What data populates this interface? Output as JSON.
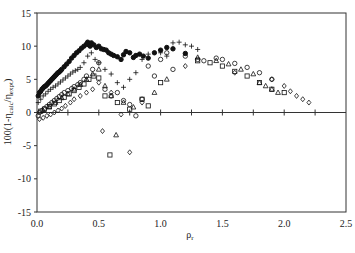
{
  "chart_data": {
    "type": "scatter",
    "title": "",
    "xlabel": "ρr",
    "xlabel_main": "ρ",
    "xlabel_sub": "r",
    "ylabel": "100(1-ηcalc/ηexpt)",
    "ylabel_parts": {
      "prefix": "100(1-η",
      "sub1": "calc",
      "mid": "/η",
      "sub2": "expt",
      "suffix": ")"
    },
    "xlim": [
      0,
      2.5
    ],
    "ylim": [
      -15,
      15
    ],
    "xticks": [
      "0.0",
      "0.5",
      "1.0",
      "1.5",
      "2.0",
      "2.5"
    ],
    "xtick_values": [
      0,
      0.5,
      1.0,
      1.5,
      2.0,
      2.5
    ],
    "yticks": [
      "15",
      "10",
      "5",
      "0",
      "-5",
      "-10",
      "-15"
    ],
    "ytick_values": [
      15,
      10,
      5,
      0,
      -5,
      -10,
      -15
    ],
    "zero_line_minor_ticks": [
      0.25,
      0.5,
      0.75,
      1.0,
      1.25,
      1.5,
      1.75,
      2.0,
      2.25
    ],
    "grid": false,
    "legend": "none",
    "series": [
      {
        "name": "filled-circle",
        "marker": "filled-circle",
        "x": [
          0.01,
          0.02,
          0.03,
          0.04,
          0.05,
          0.06,
          0.07,
          0.08,
          0.09,
          0.1,
          0.11,
          0.12,
          0.13,
          0.14,
          0.15,
          0.16,
          0.17,
          0.18,
          0.19,
          0.2,
          0.22,
          0.24,
          0.26,
          0.28,
          0.3,
          0.32,
          0.34,
          0.36,
          0.38,
          0.4,
          0.41,
          0.42,
          0.43,
          0.44,
          0.46,
          0.48,
          0.5,
          0.52,
          0.54,
          0.56,
          0.58,
          0.6,
          0.62,
          0.65,
          0.68,
          0.7,
          0.72,
          0.75,
          0.78,
          0.8,
          0.83,
          0.86,
          0.9,
          0.95,
          1.0,
          1.05,
          1.1,
          1.2
        ],
        "y": [
          2.5,
          3.0,
          3.2,
          3.5,
          3.7,
          3.9,
          4.0,
          4.2,
          4.4,
          4.6,
          4.8,
          5.0,
          5.2,
          5.4,
          5.6,
          5.8,
          6.0,
          6.1,
          6.3,
          6.5,
          6.9,
          7.3,
          7.7,
          8.2,
          8.6,
          9.0,
          9.3,
          9.7,
          10.0,
          10.3,
          10.6,
          10.2,
          10.0,
          10.5,
          10.2,
          9.8,
          10.0,
          9.6,
          9.5,
          9.4,
          9.0,
          8.8,
          8.6,
          8.4,
          8.0,
          8.7,
          9.2,
          9.0,
          8.3,
          8.6,
          8.8,
          8.5,
          8.2,
          9.0,
          9.4,
          9.8,
          9.6,
          8.9
        ]
      },
      {
        "name": "plus",
        "marker": "plus",
        "x": [
          0.01,
          0.03,
          0.05,
          0.07,
          0.09,
          0.11,
          0.13,
          0.15,
          0.17,
          0.19,
          0.21,
          0.23,
          0.25,
          0.27,
          0.29,
          0.31,
          0.33,
          0.35,
          0.38,
          0.41,
          0.44,
          0.47,
          0.5,
          0.55,
          0.6,
          0.65,
          0.7,
          0.75,
          0.8,
          0.85,
          0.9,
          1.0,
          1.05,
          1.1,
          1.15,
          1.2,
          1.25,
          1.3
        ],
        "y": [
          1.5,
          2.0,
          2.5,
          2.8,
          3.2,
          3.5,
          3.8,
          4.0,
          4.3,
          4.6,
          4.9,
          5.2,
          5.5,
          5.8,
          6.1,
          6.3,
          6.5,
          6.8,
          7.5,
          8.5,
          9.0,
          8.0,
          7.5,
          6.5,
          5.8,
          4.5,
          3.8,
          5.0,
          6.0,
          8.0,
          8.8,
          9.0,
          8.5,
          10.5,
          10.6,
          10.2,
          10.0,
          9.5
        ]
      },
      {
        "name": "open-circle",
        "marker": "open-circle",
        "x": [
          0.01,
          0.02,
          0.04,
          0.06,
          0.08,
          0.1,
          0.12,
          0.14,
          0.16,
          0.18,
          0.2,
          0.22,
          0.25,
          0.28,
          0.3,
          0.33,
          0.35,
          0.38,
          0.4,
          0.45,
          0.5,
          0.55,
          0.6,
          0.65,
          0.7,
          0.75,
          0.8,
          0.85,
          0.9,
          0.95,
          1.0,
          1.05,
          1.1,
          1.2,
          1.3,
          1.35,
          1.45,
          1.5,
          1.6,
          1.7,
          1.8,
          1.9
        ],
        "y": [
          -0.5,
          0.0,
          0.3,
          0.6,
          0.9,
          1.2,
          1.5,
          1.8,
          2.1,
          2.4,
          2.7,
          3.0,
          3.3,
          3.6,
          3.9,
          4.2,
          4.5,
          5.0,
          5.5,
          6.5,
          7.5,
          3.5,
          2.5,
          3.0,
          1.8,
          1.2,
          -0.5,
          2.0,
          7.0,
          5.5,
          8.0,
          9.0,
          6.5,
          8.5,
          8.0,
          7.8,
          8.2,
          8.0,
          7.4,
          6.8,
          6.0,
          5.0
        ]
      },
      {
        "name": "triangle",
        "marker": "triangle",
        "x": [
          0.05,
          0.1,
          0.15,
          0.2,
          0.25,
          0.3,
          0.35,
          0.4,
          0.45,
          0.5,
          0.55,
          0.6,
          0.64,
          0.7,
          0.78,
          0.95,
          1.05,
          1.3,
          1.45,
          1.55,
          1.65,
          1.75,
          1.8,
          1.85,
          1.9,
          1.95
        ],
        "y": [
          0.3,
          0.8,
          1.5,
          2.2,
          2.8,
          3.5,
          4.2,
          5.0,
          5.8,
          6.5,
          4.0,
          2.5,
          -3.4,
          1.5,
          0.8,
          3.0,
          5.0,
          8.3,
          7.8,
          7.3,
          6.5,
          5.8,
          4.5,
          4.0,
          3.5,
          3.0
        ]
      },
      {
        "name": "square",
        "marker": "square",
        "x": [
          0.03,
          0.06,
          0.1,
          0.14,
          0.18,
          0.22,
          0.26,
          0.3,
          0.34,
          0.38,
          0.42,
          0.46,
          0.5,
          0.55,
          0.59,
          0.65,
          0.75,
          0.85,
          0.9,
          1.0,
          1.3,
          1.4,
          1.5,
          1.6,
          1.7,
          1.8,
          1.9,
          2.0
        ],
        "y": [
          0.2,
          0.5,
          0.9,
          1.3,
          1.8,
          2.3,
          2.8,
          3.3,
          3.8,
          4.3,
          5.0,
          5.5,
          5.2,
          2.5,
          -6.4,
          1.5,
          0.5,
          2.0,
          1.0,
          4.5,
          7.8,
          7.5,
          7.0,
          6.2,
          5.5,
          4.5,
          3.5,
          3.0
        ]
      },
      {
        "name": "diamond",
        "marker": "diamond",
        "x": [
          0.02,
          0.05,
          0.08,
          0.11,
          0.14,
          0.17,
          0.2,
          0.23,
          0.27,
          0.3,
          0.35,
          0.4,
          0.45,
          0.5,
          0.53,
          0.6,
          0.68,
          0.75,
          0.85,
          1.2,
          1.6,
          1.9,
          2.0,
          2.05,
          2.1,
          2.15,
          2.2
        ],
        "y": [
          -1.0,
          -0.8,
          -0.5,
          -0.3,
          0.0,
          0.3,
          0.6,
          1.0,
          1.5,
          2.0,
          2.5,
          3.0,
          3.5,
          4.5,
          -2.8,
          3.0,
          -0.3,
          -6.0,
          1.5,
          7.0,
          6.0,
          5.0,
          4.0,
          3.2,
          2.5,
          2.0,
          1.5
        ]
      }
    ]
  }
}
